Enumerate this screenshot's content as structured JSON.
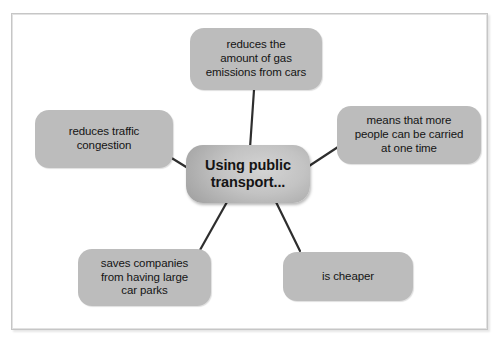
{
  "diagram": {
    "type": "mind-map",
    "center": {
      "id": "center",
      "label": "Using public\ntransport...",
      "text_plain": "Using public transport...",
      "fill_color": "#a7a7a7",
      "shape": "rounded-rectangle"
    },
    "branches": [
      {
        "id": "top",
        "label": "reduces the\namount of gas\nemissions from cars",
        "text_plain": "reduces the amount of gas emissions from cars",
        "position": "top",
        "fill_color": "#bcbcbc",
        "shape": "rounded-rectangle"
      },
      {
        "id": "left",
        "label": "reduces traffic\ncongestion",
        "text_plain": "reduces traffic congestion",
        "position": "left",
        "fill_color": "#bcbcbc",
        "shape": "rounded-rectangle"
      },
      {
        "id": "right",
        "label": "means that more\npeople can be carried\nat one time",
        "text_plain": "means that more people can be carried at one time",
        "position": "right",
        "fill_color": "#bcbcbc",
        "shape": "rounded-rectangle"
      },
      {
        "id": "bottomleft",
        "label": "saves companies\nfrom having large\ncar parks",
        "text_plain": "saves companies from having large car parks",
        "position": "bottom-left",
        "fill_color": "#bcbcbc",
        "shape": "rounded-rectangle"
      },
      {
        "id": "bottomright",
        "label": "is cheaper",
        "text_plain": "is cheaper",
        "position": "bottom-right",
        "fill_color": "#bcbcbc",
        "shape": "rounded-rectangle"
      }
    ],
    "connectors": {
      "count": 5,
      "color": "#2e2e2e",
      "style": "straight-line"
    },
    "frame": {
      "border_color": "#c6c6c6",
      "background_color": "#ffffff"
    }
  }
}
